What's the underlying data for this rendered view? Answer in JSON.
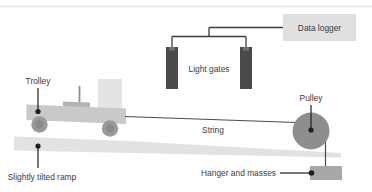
{
  "diagram": {
    "title_text": "",
    "type": "physics-apparatus-diagram",
    "canvas": {
      "width": 372,
      "height": 192,
      "background": "#ffffff"
    },
    "colors": {
      "ramp": "#e2e2e2",
      "trolley_body": "#c9c9c9",
      "trolley_block": "#b4b4b4",
      "trolley_card": "#e4e4e4",
      "wheel_outer": "#9a9a9a",
      "wheel_inner": "#8a8a8a",
      "mast": "#8f8f8f",
      "light_gate": "#4a4a4a",
      "light_gate_cap": "#6f6f6f",
      "data_logger_box": "#e0e0e0",
      "pulley": "#8e8e8e",
      "hanger": "#a8a8a8",
      "wire": "#3c3c3c",
      "string": "#4a4a4a",
      "leader": "#1e1e1e",
      "label_text": "#3c3c3c",
      "top_rule": "#e6e6e6"
    },
    "labels": {
      "trolley": "Trolley",
      "light_gates": "Light gates",
      "data_logger": "Data logger",
      "pulley": "Pulley",
      "string": "String",
      "slightly_tilted_ramp": "Slightly tilted ramp",
      "hanger_and_masses": "Hanger and masses"
    },
    "parts": {
      "light_gate_count": 2,
      "wheel_count": 2,
      "ramp_tilt": "slight downward slope to the right",
      "string_path": "from trolley over pulley down to hanger"
    }
  }
}
